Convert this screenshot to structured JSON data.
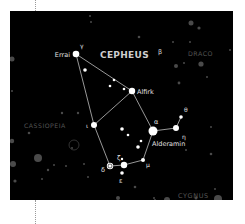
{
  "colors": {
    "background": "#000000",
    "page": "#ffffff",
    "star": "#ffffff",
    "faint_star": "#5a5a5a",
    "line": "#d8d8d8",
    "constellation_label": "#cfcfcf",
    "neighbor_label": "#555555"
  },
  "title": "CEPHEUS",
  "neighbors": {
    "draco": "DRACO",
    "cassiopeia": "CASSIOPEIA",
    "cygnus": "CYGNUS"
  },
  "stars": {
    "gamma": {
      "name": "Errai",
      "greek": "γ"
    },
    "beta": {
      "greek": "β"
    },
    "alfirk": {
      "name": "Alfirk"
    },
    "iota": {
      "greek": "ι"
    },
    "alpha": {
      "name": "Alderamin",
      "greek": "α"
    },
    "eta": {
      "greek": "η"
    },
    "theta": {
      "greek": "θ"
    },
    "delta": {
      "greek": "δ"
    },
    "zeta": {
      "greek": "ζ"
    },
    "epsilon": {
      "greek": "ε"
    },
    "mu": {
      "greek": "μ"
    }
  }
}
